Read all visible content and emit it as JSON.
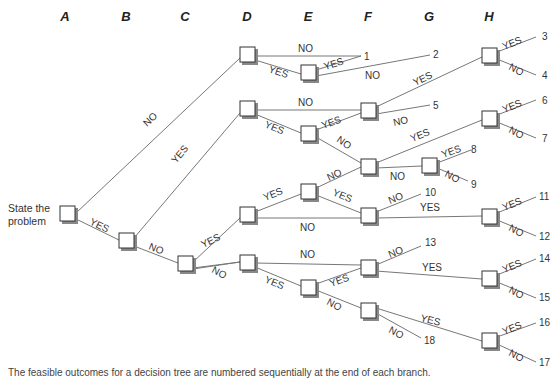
{
  "columns": [
    "A",
    "B",
    "C",
    "D",
    "E",
    "F",
    "G",
    "H"
  ],
  "start_label": [
    "State the",
    "problem"
  ],
  "nodes": {
    "root": [
      68,
      215
    ],
    "B": [
      126,
      242
    ],
    "C": [
      185,
      265
    ],
    "D1": [
      247,
      56
    ],
    "D2": [
      247,
      110
    ],
    "D3": [
      247,
      215
    ],
    "D4": [
      247,
      263
    ],
    "E1": [
      308,
      72
    ],
    "E2": [
      308,
      133
    ],
    "E3": [
      308,
      191
    ],
    "E4": [
      308,
      287
    ],
    "F1": [
      368,
      110
    ],
    "F2": [
      368,
      166
    ],
    "F3": [
      368,
      215
    ],
    "F4": [
      368,
      270
    ],
    "F5": [
      368,
      310
    ],
    "G1": [
      429,
      165
    ],
    "H1": [
      489,
      55
    ],
    "H2": [
      489,
      118
    ],
    "H3": [
      489,
      216
    ],
    "H4": [
      489,
      278
    ],
    "H5": [
      489,
      340
    ]
  },
  "edges": [
    {
      "from": "root",
      "to": "D1",
      "label": "NO"
    },
    {
      "from": "root",
      "to": "B",
      "label": "YES"
    },
    {
      "from": "B",
      "to": "D2",
      "label": "YES"
    },
    {
      "from": "B",
      "to": "C",
      "label": "NO"
    },
    {
      "from": "C",
      "to": "D3",
      "label": "YES"
    },
    {
      "from": "C",
      "to": "D4",
      "label": "NO"
    },
    {
      "from": "D1",
      "to": "out1",
      "label": "NO"
    },
    {
      "from": "D1",
      "to": "E1",
      "label": "YES"
    },
    {
      "from": "E1",
      "to": "out1",
      "label": "YES"
    },
    {
      "from": "E1",
      "to": "out2",
      "label": "NO"
    },
    {
      "from": "D2",
      "to": "F1",
      "label": "NO"
    },
    {
      "from": "D2",
      "to": "E2",
      "label": "YES"
    },
    {
      "from": "E2",
      "to": "F1",
      "label": "YES"
    },
    {
      "from": "E2",
      "to": "F2",
      "label": "NO"
    },
    {
      "from": "F1",
      "to": "H1",
      "label": "YES"
    },
    {
      "from": "F1",
      "to": "out5",
      "label": "NO"
    },
    {
      "from": "F2",
      "to": "H2",
      "label": "YES"
    },
    {
      "from": "F2",
      "to": "G1",
      "label": "NO"
    },
    {
      "from": "G1",
      "to": "out8",
      "label": "YES"
    },
    {
      "from": "G1",
      "to": "out9",
      "label": "NO"
    },
    {
      "from": "D3",
      "to": "E3",
      "label": "YES"
    },
    {
      "from": "D3",
      "to": "F3",
      "label": "NO"
    },
    {
      "from": "E3",
      "to": "F2",
      "label": "NO"
    },
    {
      "from": "E3",
      "to": "F3",
      "label": "YES"
    },
    {
      "from": "F3",
      "to": "out10",
      "label": "NO"
    },
    {
      "from": "F3",
      "to": "H3",
      "label": "YES"
    },
    {
      "from": "D4",
      "to": "F4",
      "label": "NO"
    },
    {
      "from": "D4",
      "to": "E4",
      "label": "YES"
    },
    {
      "from": "E4",
      "to": "F4",
      "label": "YES"
    },
    {
      "from": "E4",
      "to": "F5",
      "label": "NO"
    },
    {
      "from": "F4",
      "to": "out13",
      "label": "NO"
    },
    {
      "from": "F4",
      "to": "H4",
      "label": "YES"
    },
    {
      "from": "F5",
      "to": "H5",
      "label": "YES"
    },
    {
      "from": "F5",
      "to": "out18",
      "label": "NO"
    },
    {
      "from": "H1",
      "to": "out3",
      "label": "YES"
    },
    {
      "from": "H1",
      "to": "out4",
      "label": "NO"
    },
    {
      "from": "H2",
      "to": "out6",
      "label": "YES"
    },
    {
      "from": "H2",
      "to": "out7",
      "label": "NO"
    },
    {
      "from": "H3",
      "to": "out11",
      "label": "YES"
    },
    {
      "from": "H3",
      "to": "out12",
      "label": "NO"
    },
    {
      "from": "H4",
      "to": "out14",
      "label": "YES"
    },
    {
      "from": "H4",
      "to": "out15",
      "label": "NO"
    },
    {
      "from": "H5",
      "to": "out16",
      "label": "YES"
    },
    {
      "from": "H5",
      "to": "out17",
      "label": "NO"
    }
  ],
  "outcomes": [
    "1",
    "2",
    "3",
    "4",
    "5",
    "6",
    "7",
    "8",
    "9",
    "10",
    "11",
    "12",
    "13",
    "14",
    "15",
    "16",
    "17",
    "18"
  ],
  "caption": "The feasible outcomes for a decision tree are numbered sequentially at the end of each branch."
}
